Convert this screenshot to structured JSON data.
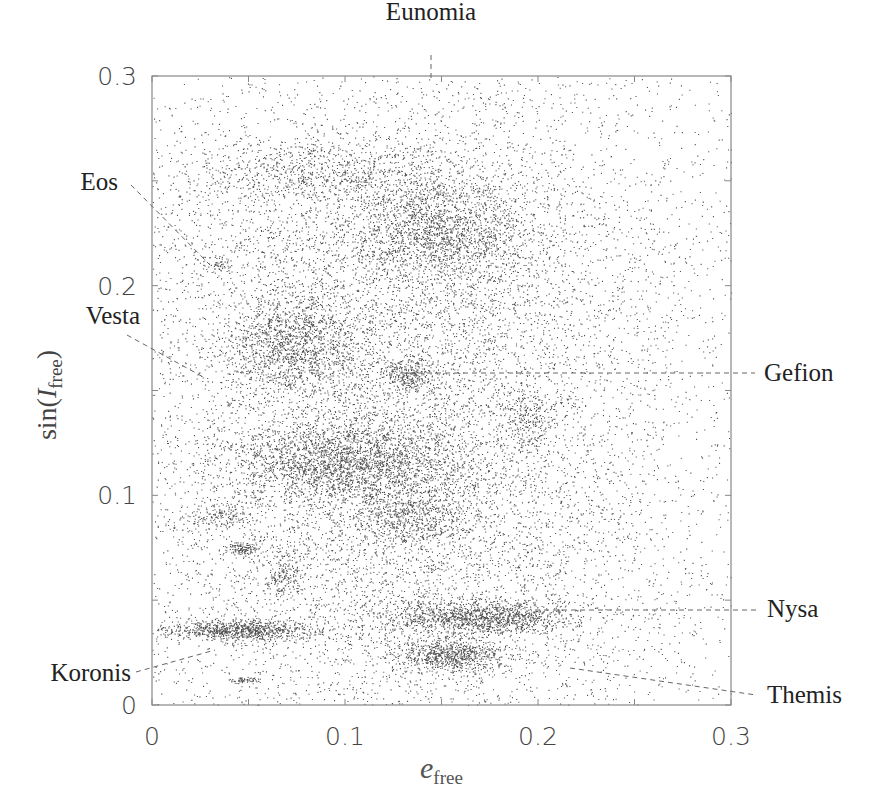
{
  "chart_data": {
    "type": "scatter",
    "title": "",
    "xlabel": "e_free",
    "ylabel": "sin(I_free)",
    "xlim": [
      0,
      0.3
    ],
    "ylim": [
      0,
      0.3
    ],
    "grid": false,
    "legend": null,
    "x_ticks": [
      {
        "value": 0,
        "label": "0"
      },
      {
        "value": 0.1,
        "label": "0.1"
      },
      {
        "value": 0.2,
        "label": "0.2"
      },
      {
        "value": 0.3,
        "label": "0.3"
      }
    ],
    "y_ticks": [
      {
        "value": 0,
        "label": "0"
      },
      {
        "value": 0.1,
        "label": "0.1"
      },
      {
        "value": 0.2,
        "label": "0.2"
      },
      {
        "value": 0.3,
        "label": "0.3"
      }
    ],
    "minor_tick_step": 0.05,
    "point_color": "#1a1a1a",
    "background_density": [
      {
        "name": "broad-main",
        "cx": 0.13,
        "cy": 0.11,
        "sx": 0.07,
        "sy": 0.075,
        "n": 9000
      },
      {
        "name": "broad-upper",
        "cx": 0.13,
        "cy": 0.22,
        "sx": 0.075,
        "sy": 0.04,
        "n": 3000
      },
      {
        "name": "uniform",
        "x0": 0.0,
        "x1": 0.3,
        "y0": 0.0,
        "y1": 0.3,
        "n": 2500
      }
    ],
    "clusters": [
      {
        "name": "Eunomia-region upper",
        "cx": 0.15,
        "cy": 0.228,
        "sx": 0.022,
        "sy": 0.012,
        "n": 1400
      },
      {
        "name": "upper arc",
        "cx": 0.09,
        "cy": 0.255,
        "sx": 0.035,
        "sy": 0.008,
        "n": 700
      },
      {
        "name": "Vesta-region",
        "cx": 0.072,
        "cy": 0.172,
        "sx": 0.018,
        "sy": 0.012,
        "n": 1300
      },
      {
        "name": "Gefion-region",
        "cx": 0.132,
        "cy": 0.158,
        "sx": 0.008,
        "sy": 0.004,
        "n": 250
      },
      {
        "name": "central dense",
        "cx": 0.1,
        "cy": 0.115,
        "sx": 0.03,
        "sy": 0.01,
        "n": 2200
      },
      {
        "name": "mid",
        "cx": 0.135,
        "cy": 0.09,
        "sx": 0.015,
        "sy": 0.007,
        "n": 500
      },
      {
        "name": "right mid",
        "cx": 0.195,
        "cy": 0.135,
        "sx": 0.006,
        "sy": 0.008,
        "n": 200
      },
      {
        "name": "small left 1",
        "cx": 0.035,
        "cy": 0.09,
        "sx": 0.008,
        "sy": 0.003,
        "n": 150
      },
      {
        "name": "small left 2",
        "cx": 0.047,
        "cy": 0.075,
        "sx": 0.004,
        "sy": 0.0015,
        "n": 120
      },
      {
        "name": "small left 3",
        "cx": 0.068,
        "cy": 0.063,
        "sx": 0.006,
        "sy": 0.005,
        "n": 180
      },
      {
        "name": "Koronis band",
        "cx": 0.045,
        "cy": 0.036,
        "sx": 0.02,
        "sy": 0.0025,
        "n": 900
      },
      {
        "name": "Nysa band",
        "cx": 0.17,
        "cy": 0.042,
        "sx": 0.025,
        "sy": 0.004,
        "n": 1300
      },
      {
        "name": "Themis-region",
        "cx": 0.155,
        "cy": 0.024,
        "sx": 0.015,
        "sy": 0.004,
        "n": 800
      },
      {
        "name": "tiny bottom",
        "cx": 0.047,
        "cy": 0.012,
        "sx": 0.004,
        "sy": 0.0008,
        "n": 60
      },
      {
        "name": "Eos small",
        "cx": 0.035,
        "cy": 0.21,
        "sx": 0.003,
        "sy": 0.002,
        "n": 40
      }
    ],
    "annotations": [
      {
        "label": "Eunomia",
        "text_x": 431,
        "text_y": 20,
        "line": [
          [
            431,
            55
          ],
          [
            431,
            80
          ]
        ],
        "anchor": "middle"
      },
      {
        "label": "Eos",
        "text_x": 118,
        "text_y": 190,
        "line": [
          [
            131,
            185
          ],
          [
            210,
            265
          ]
        ],
        "anchor": "end"
      },
      {
        "label": "Vesta",
        "text_x": 140,
        "text_y": 324,
        "line": [
          [
            127,
            335
          ],
          [
            205,
            378
          ]
        ],
        "anchor": "end"
      },
      {
        "label": "Gefion",
        "text_x": 764,
        "text_y": 381,
        "line": [
          [
            400,
            373
          ],
          [
            755,
            373
          ]
        ],
        "anchor": "start"
      },
      {
        "label": "Nysa",
        "text_x": 767,
        "text_y": 617,
        "line": [
          [
            535,
            610
          ],
          [
            758,
            610
          ]
        ],
        "anchor": "start"
      },
      {
        "label": "Koronis",
        "text_x": 131,
        "text_y": 681,
        "line": [
          [
            136,
            672
          ],
          [
            215,
            650
          ]
        ],
        "anchor": "end"
      },
      {
        "label": "Themis",
        "text_x": 767,
        "text_y": 703,
        "line": [
          [
            570,
            668
          ],
          [
            756,
            695
          ]
        ],
        "anchor": "start"
      }
    ]
  }
}
